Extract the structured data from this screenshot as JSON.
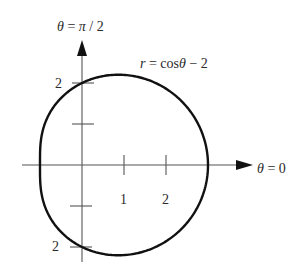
{
  "chart_data": {
    "type": "line",
    "coordinate_system": "polar",
    "title": "",
    "equation": "r = cosθ − 2",
    "equation_label": {
      "r": "r",
      "eq": " = ",
      "cos": "cos",
      "theta": "θ",
      "rest": " − 2"
    },
    "axis_labels": {
      "polar_axis": "θ = 0",
      "vertical_axis": "θ = π / 2"
    },
    "axis_label_parts": {
      "polar_axis": {
        "theta": "θ",
        "rest": " = 0"
      },
      "vertical_axis": {
        "theta": "θ",
        "eq": " = ",
        "pi": "π",
        "rest": " / 2"
      }
    },
    "x_ticks": [
      1,
      2
    ],
    "x_tick_labels": [
      "1",
      "2"
    ],
    "y_ticks": [
      2,
      1,
      -1,
      -2
    ],
    "y_tick_labels_shown": {
      "top": "2",
      "bottom": "2"
    },
    "grid": false,
    "key_points": [
      {
        "theta": "0",
        "r": -1,
        "x": -1,
        "y": 0
      },
      {
        "theta": "π/2",
        "r": -2,
        "x": 0,
        "y": -2
      },
      {
        "theta": "π",
        "r": -3,
        "x": 3,
        "y": 0
      },
      {
        "theta": "3π/2",
        "r": -2,
        "x": 0,
        "y": 2
      }
    ],
    "xlim": [
      -1.8,
      4.1
    ],
    "ylim": [
      -2.6,
      3.0
    ],
    "stroke_color": "#111111",
    "axis_color": "#555555"
  }
}
